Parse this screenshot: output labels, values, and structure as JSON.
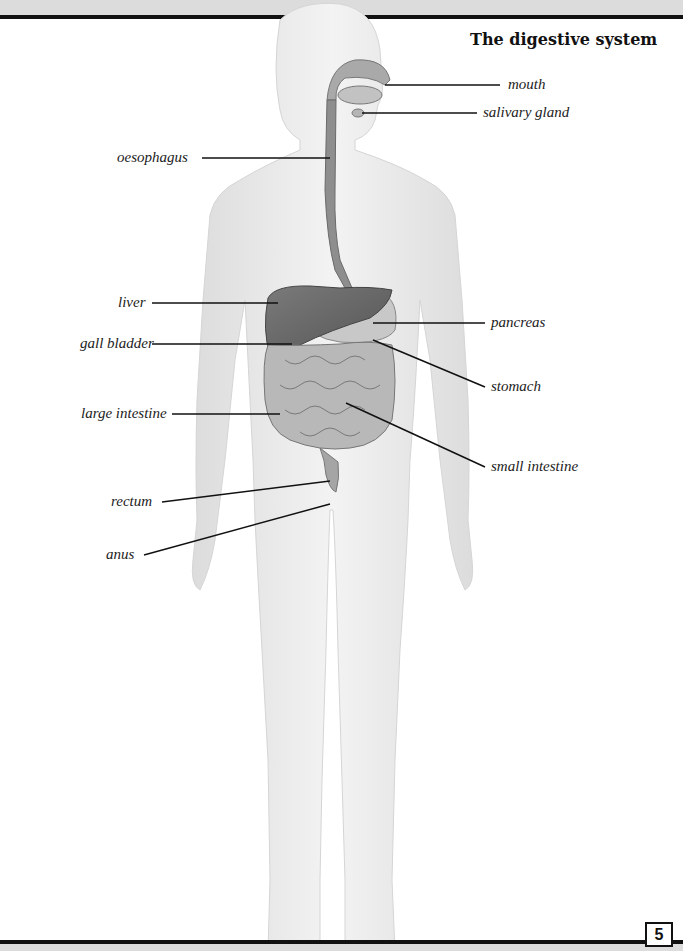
{
  "title": "The digestive system",
  "labels": {
    "mouth": "mouth",
    "salivary_gland": "salivary gland",
    "oesophagus": "oesophagus",
    "liver": "liver",
    "gall_bladder": "gall bladder",
    "large_intestine": "large intestine",
    "rectum": "rectum",
    "anus": "anus",
    "pancreas": "pancreas",
    "stomach": "stomach",
    "small_intestine": "small intestine"
  },
  "page_number": "5",
  "colors": {
    "body": "#ececec",
    "organ_dark": "#6a6a6a",
    "organ_mid": "#a9a9a9",
    "organ_light": "#c8c8c8",
    "leader_line": "#111111"
  }
}
